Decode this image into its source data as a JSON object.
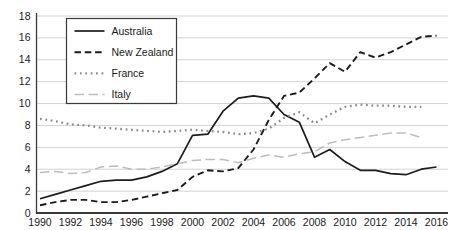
{
  "chart_data": {
    "type": "line",
    "title": "",
    "xlabel": "",
    "ylabel": "",
    "x": [
      1990,
      1991,
      1992,
      1993,
      1994,
      1995,
      1996,
      1997,
      1998,
      1999,
      2000,
      2001,
      2002,
      2003,
      2004,
      2005,
      2006,
      2007,
      2008,
      2009,
      2010,
      2011,
      2012,
      2013,
      2014,
      2015,
      2016
    ],
    "xtick_labels": [
      "1990",
      "1992",
      "1994",
      "1996",
      "1998",
      "2000",
      "2002",
      "2004",
      "2006",
      "2008",
      "2010",
      "2012",
      "2014",
      "2016"
    ],
    "ytick_labels": [
      "0",
      "2",
      "4",
      "6",
      "8",
      "10",
      "12",
      "14",
      "16",
      "18"
    ],
    "ylim": [
      0,
      18
    ],
    "ytick_step": 2,
    "grid": "horizontal",
    "legend_position": "upper-left-inside",
    "series": [
      {
        "name": "Australia",
        "style": "solid",
        "color": "#1c1c1c",
        "width": 1.7,
        "values": [
          1.3,
          1.7,
          2.1,
          2.5,
          2.9,
          3.0,
          3.0,
          3.3,
          3.8,
          4.5,
          7.1,
          7.2,
          9.3,
          10.5,
          10.7,
          10.5,
          9.0,
          8.3,
          5.1,
          5.8,
          4.7,
          3.9,
          3.9,
          3.6,
          3.5,
          4.0,
          4.2
        ]
      },
      {
        "name": "New Zealand",
        "style": "dashed",
        "color": "#1c1c1c",
        "width": 1.9,
        "values": [
          0.7,
          1.0,
          1.2,
          1.2,
          1.0,
          1.0,
          1.2,
          1.5,
          1.8,
          2.1,
          3.3,
          3.9,
          3.8,
          4.1,
          5.8,
          8.5,
          10.7,
          11.0,
          12.3,
          13.7,
          12.9,
          14.7,
          14.2,
          14.7,
          15.4,
          16.1,
          16.2
        ]
      },
      {
        "name": "France",
        "style": "dotted",
        "color": "#8d8d8d",
        "width": 2.3,
        "values": [
          8.6,
          8.4,
          8.1,
          8.0,
          7.8,
          7.7,
          7.6,
          7.5,
          7.4,
          7.5,
          7.6,
          7.5,
          7.4,
          7.2,
          7.3,
          7.7,
          8.7,
          9.2,
          8.2,
          9.0,
          9.7,
          9.9,
          9.8,
          9.8,
          9.7,
          9.7,
          null
        ]
      },
      {
        "name": "Italy",
        "style": "long-dash",
        "color": "#bdbdbd",
        "width": 1.5,
        "values": [
          3.7,
          3.8,
          3.6,
          3.7,
          4.2,
          4.3,
          4.0,
          4.0,
          4.2,
          4.5,
          4.8,
          4.9,
          4.9,
          4.6,
          5.0,
          5.3,
          5.1,
          5.4,
          5.6,
          6.4,
          6.7,
          6.9,
          7.1,
          7.3,
          7.3,
          6.9,
          null
        ]
      }
    ]
  },
  "colors": {
    "background": "#ffffff",
    "grid": "#d2d2d2",
    "axis": "#3a3a3a",
    "tick_text": "#1a1a1a",
    "legend_border": "#3a3a3a",
    "legend_background": "#ffffff",
    "legend_text": "#1a1a1a"
  }
}
